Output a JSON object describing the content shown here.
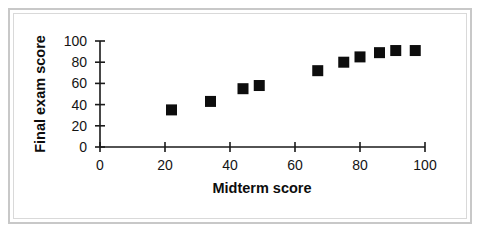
{
  "chart_data": {
    "type": "scatter",
    "title": "",
    "xlabel": "Midterm score",
    "ylabel": "Final exam score",
    "xlim": [
      0,
      100
    ],
    "ylim": [
      0,
      100
    ],
    "xticks": [
      0,
      20,
      40,
      60,
      80,
      100
    ],
    "yticks": [
      0,
      20,
      40,
      60,
      80,
      100
    ],
    "xtick_labels": [
      "0",
      "20",
      "40",
      "60",
      "80",
      "100"
    ],
    "ytick_labels": [
      "0",
      "20",
      "40",
      "60",
      "80",
      "100"
    ],
    "grid": false,
    "legend": null,
    "marker": "square",
    "marker_color": "#0d0d0d",
    "series": [
      {
        "name": "students",
        "points": [
          {
            "x": 22,
            "y": 35
          },
          {
            "x": 34,
            "y": 43
          },
          {
            "x": 44,
            "y": 55
          },
          {
            "x": 49,
            "y": 58
          },
          {
            "x": 67,
            "y": 72
          },
          {
            "x": 75,
            "y": 80
          },
          {
            "x": 80,
            "y": 85
          },
          {
            "x": 86,
            "y": 89
          },
          {
            "x": 91,
            "y": 91
          },
          {
            "x": 97,
            "y": 91
          }
        ]
      }
    ]
  },
  "frame": {
    "border_color": "#c8c8c8",
    "inner_border_color": "#d9d9d9"
  }
}
